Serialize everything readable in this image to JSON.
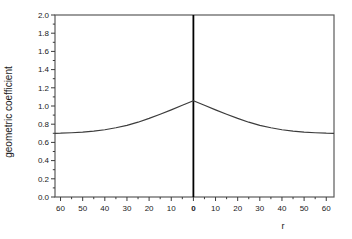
{
  "chart_data": {
    "type": "line",
    "title": "",
    "xlabel": "r",
    "ylabel": "geometric coefficient",
    "xlim": [
      -62.5,
      63.5
    ],
    "ylim": [
      0,
      2
    ],
    "grid": false,
    "legend": "none",
    "x_major_ticks": [
      -60,
      -50,
      -40,
      -30,
      -20,
      -10,
      0,
      10,
      20,
      30,
      40,
      50,
      60
    ],
    "x_tick_labels": [
      "60",
      "50",
      "40",
      "30",
      "20",
      "10",
      "0",
      "10",
      "20",
      "30",
      "40",
      "50",
      "60"
    ],
    "x_minor_step": 5,
    "bold_x_value": 0,
    "y_major_ticks": [
      0.0,
      0.2,
      0.4,
      0.6,
      0.8,
      1.0,
      1.2,
      1.4,
      1.6,
      1.8,
      2.0
    ],
    "y_tick_labels": [
      "0.0",
      "0.2",
      "0.4",
      "0.6",
      "0.8",
      "1.0",
      "1.2",
      "1.4",
      "1.6",
      "1.8",
      "2.0"
    ],
    "y_minor_step": 0.1,
    "center_line_x": 0,
    "series": [
      {
        "name": "geometric coefficient curve",
        "x": [
          -62.5,
          -60,
          -55,
          -50,
          -45,
          -40,
          -35,
          -30,
          -25,
          -20,
          -15,
          -10,
          -5,
          0,
          5,
          10,
          15,
          20,
          25,
          30,
          35,
          40,
          45,
          50,
          55,
          60,
          63.5
        ],
        "y": [
          0.7,
          0.701,
          0.706,
          0.713,
          0.723,
          0.739,
          0.761,
          0.787,
          0.822,
          0.864,
          0.91,
          0.958,
          1.008,
          1.058,
          1.008,
          0.958,
          0.91,
          0.864,
          0.822,
          0.787,
          0.761,
          0.739,
          0.723,
          0.713,
          0.706,
          0.701,
          0.7
        ]
      }
    ],
    "colors": {
      "curve": "#3c3c3c",
      "frame": "#5a5a5a",
      "tick": "#3a3a3a",
      "center_line": "#000000",
      "text": "#1a1a1a"
    }
  }
}
